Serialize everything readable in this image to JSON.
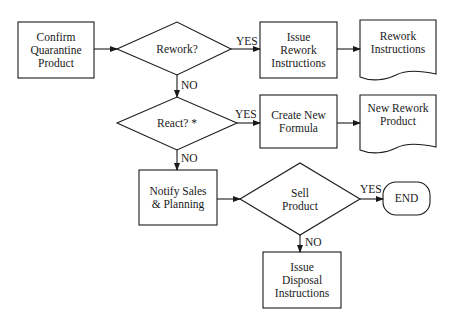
{
  "diagram": {
    "type": "flowchart",
    "nodes": {
      "confirm": {
        "shape": "process",
        "lines": [
          "Confirm",
          "Quarantine",
          "Product"
        ]
      },
      "rework": {
        "shape": "decision",
        "lines": [
          "Rework?"
        ]
      },
      "issue_rework": {
        "shape": "process",
        "lines": [
          "Issue",
          "Rework",
          "Instructions"
        ]
      },
      "rework_instructions": {
        "shape": "document",
        "lines": [
          "Rework",
          "Instructions"
        ]
      },
      "react": {
        "shape": "decision",
        "lines": [
          "React? *"
        ]
      },
      "create_formula": {
        "shape": "process",
        "lines": [
          "Create New",
          "Formula"
        ]
      },
      "new_rework_product": {
        "shape": "document",
        "lines": [
          "New Rework",
          "Product"
        ]
      },
      "notify": {
        "shape": "process",
        "lines": [
          "Notify Sales",
          "& Planning"
        ]
      },
      "sell": {
        "shape": "decision",
        "lines": [
          "Sell",
          "Product"
        ]
      },
      "end": {
        "shape": "terminator",
        "lines": [
          "END"
        ]
      },
      "disposal": {
        "shape": "process",
        "lines": [
          "Issue",
          "Disposal",
          "Instructions"
        ]
      }
    },
    "edges": [
      {
        "from": "confirm",
        "to": "rework",
        "label": ""
      },
      {
        "from": "rework",
        "to": "issue_rework",
        "label": "YES"
      },
      {
        "from": "issue_rework",
        "to": "rework_instructions",
        "label": ""
      },
      {
        "from": "rework",
        "to": "react",
        "label": "NO"
      },
      {
        "from": "react",
        "to": "create_formula",
        "label": "YES"
      },
      {
        "from": "create_formula",
        "to": "new_rework_product",
        "label": ""
      },
      {
        "from": "react",
        "to": "notify",
        "label": "NO"
      },
      {
        "from": "notify",
        "to": "sell",
        "label": ""
      },
      {
        "from": "sell",
        "to": "end",
        "label": "YES"
      },
      {
        "from": "sell",
        "to": "disposal",
        "label": "NO"
      }
    ],
    "edge_labels": {
      "rework_yes": "YES",
      "rework_no": "NO",
      "react_yes": "YES",
      "react_no": "NO",
      "sell_yes": "YES",
      "sell_no": "NO"
    }
  }
}
